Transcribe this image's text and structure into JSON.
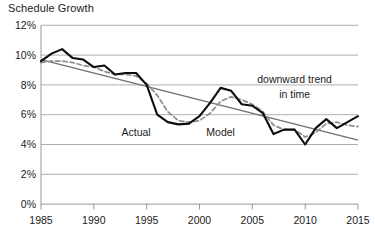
{
  "chart_data": {
    "type": "line",
    "title": "Schedule Growth",
    "xlabel": "",
    "ylabel": "",
    "xlim": [
      1985,
      2015
    ],
    "ylim": [
      0,
      12
    ],
    "grid": true,
    "legend_position": "inline-annotations",
    "y_ticks": [
      "0%",
      "2%",
      "4%",
      "6%",
      "8%",
      "10%",
      "12%"
    ],
    "y_tick_values": [
      0,
      2,
      4,
      6,
      8,
      10,
      12
    ],
    "x_ticks": [
      "1985",
      "1990",
      "1995",
      "2000",
      "2005",
      "2010",
      "2015"
    ],
    "x_tick_values": [
      1985,
      1990,
      1995,
      2000,
      2005,
      2010,
      2015
    ],
    "x": [
      1985,
      1986,
      1987,
      1988,
      1989,
      1990,
      1991,
      1992,
      1993,
      1994,
      1995,
      1996,
      1997,
      1998,
      1999,
      2000,
      2001,
      2002,
      2003,
      2004,
      2005,
      2006,
      2007,
      2008,
      2009,
      2010,
      2011,
      2012,
      2013,
      2014,
      2015
    ],
    "series": [
      {
        "name": "Actual",
        "style": "solid",
        "color": "#0d0d0d",
        "values": [
          9.6,
          10.1,
          10.4,
          9.8,
          9.7,
          9.2,
          9.3,
          8.7,
          8.8,
          8.8,
          8.0,
          6.0,
          5.5,
          5.35,
          5.4,
          5.9,
          6.8,
          7.8,
          7.6,
          6.7,
          6.6,
          6.1,
          4.7,
          5.0,
          5.0,
          4.0,
          5.1,
          5.7,
          5.1,
          5.5,
          5.9
        ]
      },
      {
        "name": "Model",
        "style": "dashed",
        "color": "#8e8e8e",
        "values": [
          9.5,
          9.6,
          9.6,
          9.5,
          9.3,
          9.2,
          8.9,
          8.7,
          8.7,
          8.6,
          8.1,
          7.3,
          6.2,
          5.6,
          5.5,
          5.6,
          6.1,
          6.9,
          7.2,
          7.0,
          6.7,
          6.2,
          5.3,
          5.0,
          5.0,
          4.5,
          4.8,
          5.4,
          5.5,
          5.3,
          5.2
        ]
      },
      {
        "name": "downward trend in time",
        "style": "straight",
        "color": "#6f6f6f",
        "endpoints": [
          [
            1985,
            9.7
          ],
          [
            2015,
            4.3
          ]
        ]
      }
    ],
    "annotations": [
      {
        "text": "Actual",
        "x": 1994.0,
        "y": 4.6
      },
      {
        "text": "Model",
        "x": 2002.0,
        "y": 4.6
      },
      {
        "text": "downward trend",
        "x": 2009.0,
        "y": 8.1
      },
      {
        "text": "in time",
        "x": 2009.0,
        "y": 7.1
      }
    ]
  }
}
